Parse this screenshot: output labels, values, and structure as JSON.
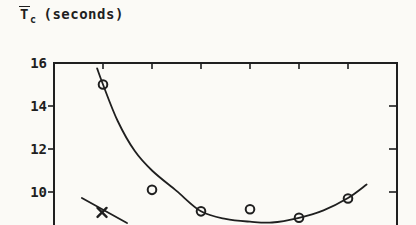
{
  "figure": {
    "title": {
      "symbol": "T",
      "subscript": "c",
      "units": "(seconds)"
    },
    "ink_color": "#1f1f1f",
    "paper_color": "#fbfaf6"
  },
  "chart_data": {
    "type": "scatter",
    "ylabel": "T̄c (seconds)",
    "xlabel": "",
    "grid": false,
    "legend": "none",
    "y_axis": {
      "tick_labels": [
        "16",
        "14",
        "12",
        "10"
      ],
      "tick_values": [
        16,
        14,
        12,
        10
      ],
      "side_tick_values": [
        14,
        12,
        10
      ],
      "visible_range": [
        8.5,
        16
      ]
    },
    "x_axis": {
      "ticks": [
        1,
        2,
        3,
        4,
        5,
        6
      ],
      "tick_labels": [],
      "labels_visible": false
    },
    "series": [
      {
        "name": "mean-completion-time-points",
        "type": "scatter",
        "marker": "circle",
        "points": [
          [
            1,
            15.0
          ],
          [
            2,
            10.1
          ],
          [
            3,
            9.1
          ],
          [
            4,
            9.2
          ],
          [
            5,
            8.8
          ],
          [
            6,
            9.7
          ]
        ]
      },
      {
        "name": "fitted-curve",
        "type": "line",
        "points": [
          [
            0.88,
            15.75
          ],
          [
            1.0,
            15.0
          ],
          [
            1.3,
            13.3
          ],
          [
            1.65,
            11.9
          ],
          [
            2.0,
            11.0
          ],
          [
            2.5,
            10.05
          ],
          [
            3.0,
            9.1
          ],
          [
            3.5,
            8.75
          ],
          [
            4.0,
            8.62
          ],
          [
            4.45,
            8.58
          ],
          [
            5.0,
            8.8
          ],
          [
            5.5,
            9.15
          ],
          [
            6.0,
            9.72
          ],
          [
            6.38,
            10.35
          ]
        ]
      },
      {
        "name": "steep-line-segment",
        "type": "line",
        "marker": "x",
        "points": [
          [
            0.57,
            9.72
          ],
          [
            1.49,
            8.56
          ]
        ],
        "marker_points": [
          [
            0.98,
            9.05
          ]
        ]
      }
    ]
  }
}
